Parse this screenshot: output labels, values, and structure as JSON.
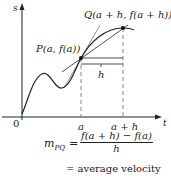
{
  "figure": {
    "axes": {
      "y_label": "s",
      "x_label": "t",
      "origin_label": "0"
    },
    "ticks": {
      "a": "a",
      "a_plus_h": "a + h"
    },
    "points": {
      "P": "P(a, f(a))",
      "Q": "Q(a + h, f(a + h))"
    },
    "interval_label": "h",
    "formula": {
      "lhs": "m",
      "lhs_sub": "PQ",
      "equals": "=",
      "numerator": "f(a + h) − f(a)",
      "denominator": "h",
      "result": "= average velocity"
    },
    "colors": {
      "curve": "#222222",
      "axes": "#222222",
      "secant": "#222222",
      "tangent": "#666666",
      "dashed": "#666666",
      "points": "#111111"
    }
  }
}
